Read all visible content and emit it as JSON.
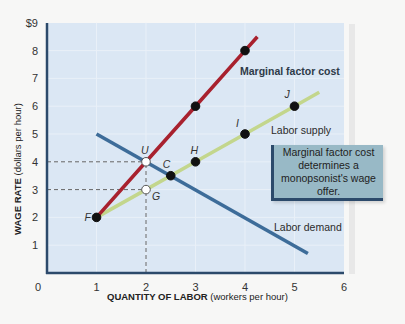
{
  "chart_data": {
    "type": "line",
    "title": "",
    "xlabel_bold": "QUANTITY OF LABOR",
    "xlabel_unit": "(workers per hour)",
    "ylabel_bold": "WAGE RATE",
    "ylabel_unit": "(dollars per hour)",
    "xlim": [
      0,
      6
    ],
    "ylim": [
      0,
      9
    ],
    "x_ticks": [
      "0",
      "1",
      "2",
      "3",
      "4",
      "5",
      "6"
    ],
    "y_ticks": [
      "1",
      "2",
      "3",
      "4",
      "5",
      "6",
      "7",
      "8",
      "$9"
    ],
    "grid": true,
    "series": [
      {
        "name": "Marginal factor cost",
        "color": "#a8212e",
        "x": [
          1,
          2,
          3,
          4,
          4.25
        ],
        "y": [
          2,
          4,
          6,
          8,
          8.5
        ]
      },
      {
        "name": "Labor supply",
        "color": "#c3d68c",
        "x": [
          1,
          2,
          3,
          4,
          5,
          5.5
        ],
        "y": [
          2,
          3,
          4,
          5,
          6,
          6.5
        ]
      },
      {
        "name": "Labor demand",
        "color": "#3d6c99",
        "x": [
          1,
          5.27
        ],
        "y": [
          5,
          0.7
        ]
      }
    ],
    "points": [
      {
        "label": "F",
        "x": 1,
        "y": 2,
        "filled": true
      },
      {
        "label": "U",
        "x": 2,
        "y": 4,
        "filled": false
      },
      {
        "label": "G",
        "x": 2,
        "y": 3,
        "filled": false
      },
      {
        "label": "C",
        "x": 2.5,
        "y": 3.5,
        "filled": true
      },
      {
        "label": "H",
        "x": 3,
        "y": 4,
        "filled": true
      },
      {
        "label": "I",
        "x": 4,
        "y": 5,
        "filled": true
      },
      {
        "label": "J",
        "x": 5,
        "y": 6,
        "filled": true
      },
      {
        "label": "",
        "x": 3,
        "y": 6,
        "filled": true
      },
      {
        "label": "",
        "x": 4,
        "y": 8,
        "filled": true
      }
    ],
    "reference_lines": [
      {
        "type": "dashed",
        "from": [
          0,
          4
        ],
        "to": [
          2,
          4
        ]
      },
      {
        "type": "dashed",
        "from": [
          0,
          3
        ],
        "to": [
          2,
          3
        ]
      },
      {
        "type": "dashed",
        "from": [
          2,
          0
        ],
        "to": [
          2,
          4
        ]
      }
    ],
    "annotations": {
      "mfc_label": "Marginal factor cost",
      "supply_label": "Labor supply",
      "demand_label": "Labor demand",
      "callout": "Marginal factor cost determines a monopsonist's wage offer."
    }
  }
}
